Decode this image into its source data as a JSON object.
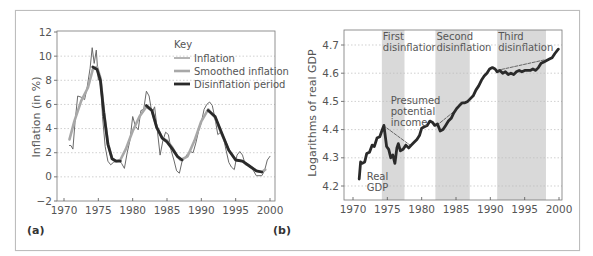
{
  "figure": {
    "panels": [
      "(a)",
      "(b)"
    ]
  },
  "chart_data": [
    {
      "type": "line",
      "panel": "(a)",
      "title": "",
      "xlabel": "",
      "ylabel": "Inflation (in %)",
      "xlim": [
        1970,
        2000
      ],
      "ylim": [
        -2,
        12
      ],
      "x_ticks": [
        1970,
        1975,
        1980,
        1985,
        1990,
        1995,
        2000
      ],
      "y_ticks": [
        -2,
        0,
        2,
        4,
        6,
        8,
        10,
        12
      ],
      "grid": "horizontal dotted",
      "legend": {
        "title": "Key",
        "position": "upper right",
        "entries": [
          "Inflation",
          "Smoothed inflation",
          "Disinflation period"
        ]
      },
      "series": [
        {
          "name": "Inflation",
          "style": "thin dark gray",
          "x": [
            1970.8,
            1971.0,
            1971.3,
            1971.6,
            1972.0,
            1972.5,
            1973.0,
            1973.4,
            1973.8,
            1974.1,
            1974.4,
            1974.7,
            1975.0,
            1975.3,
            1975.6,
            1976.0,
            1976.4,
            1976.8,
            1977.2,
            1977.6,
            1978.0,
            1978.4,
            1978.8,
            1979.2,
            1979.6,
            1980.0,
            1980.4,
            1980.8,
            1981.2,
            1981.6,
            1982.0,
            1982.4,
            1982.8,
            1983.2,
            1983.6,
            1984.0,
            1984.4,
            1984.8,
            1985.2,
            1985.6,
            1986.0,
            1986.4,
            1986.8,
            1987.2,
            1987.6,
            1988.0,
            1988.4,
            1988.8,
            1989.2,
            1989.6,
            1990.0,
            1990.4,
            1990.8,
            1991.2,
            1991.6,
            1992.0,
            1992.4,
            1992.8,
            1993.2,
            1993.6,
            1994.0,
            1994.4,
            1994.8,
            1995.2,
            1995.6,
            1996.0,
            1996.4,
            1996.8,
            1997.2,
            1997.6,
            1998.0,
            1998.4,
            1998.8,
            1999.2,
            1999.6,
            2000.0
          ],
          "y": [
            2.6,
            2.6,
            2.3,
            4.5,
            6.7,
            6.6,
            6.4,
            7.5,
            9.0,
            10.7,
            9.4,
            10.5,
            8.0,
            8.3,
            5.0,
            2.5,
            1.3,
            1.0,
            1.2,
            1.3,
            1.4,
            1.1,
            0.7,
            2.0,
            3.0,
            5.0,
            4.2,
            3.9,
            5.5,
            5.6,
            7.1,
            6.7,
            5.3,
            5.8,
            3.8,
            1.8,
            3.0,
            3.7,
            3.5,
            2.2,
            1.4,
            0.5,
            0.3,
            1.3,
            1.6,
            1.9,
            2.1,
            2.0,
            2.8,
            3.8,
            4.5,
            5.6,
            6.0,
            6.2,
            5.9,
            4.8,
            3.5,
            3.7,
            3.3,
            2.2,
            1.2,
            0.8,
            0.6,
            1.8,
            2.1,
            1.8,
            1.0,
            1.0,
            0.8,
            0.5,
            0.1,
            0.1,
            0.1,
            0.5,
            1.4,
            1.7
          ]
        },
        {
          "name": "Smoothed inflation",
          "style": "thick light gray",
          "x": [
            1970.8,
            1971.5,
            1972.5,
            1973.5,
            1974.2,
            1974.8,
            1975.3,
            1975.8,
            1976.4,
            1977.0,
            1977.6,
            1978.2,
            1979.0,
            1980.0,
            1981.0,
            1982.0,
            1982.8,
            1983.5,
            1984.3,
            1985.0,
            1985.8,
            1986.5,
            1987.0,
            1988.0,
            1989.0,
            1990.0,
            1991.0,
            1992.0,
            1993.0,
            1994.0,
            1995.0,
            1996.0,
            1997.0,
            1998.0,
            1998.8,
            1999.3
          ],
          "y": [
            3.1,
            4.6,
            6.3,
            7.4,
            8.9,
            9.1,
            8.2,
            5.5,
            2.8,
            1.5,
            1.3,
            1.4,
            2.3,
            3.8,
            5.0,
            5.8,
            5.5,
            4.1,
            3.2,
            3.0,
            2.4,
            1.7,
            1.4,
            1.7,
            3.0,
            4.6,
            5.6,
            4.9,
            3.5,
            2.2,
            1.4,
            1.3,
            0.9,
            0.5,
            0.4,
            0.6
          ]
        },
        {
          "name": "Disinflation period",
          "style": "thick black",
          "segments": [
            {
              "x": [
                1974.2,
                1974.8,
                1975.3,
                1975.8,
                1976.4,
                1977.0,
                1977.6,
                1978.2
              ],
              "y": [
                9.1,
                8.9,
                8.0,
                5.3,
                2.7,
                1.5,
                1.3,
                1.3
              ]
            },
            {
              "x": [
                1982.0,
                1982.8,
                1983.5,
                1984.3,
                1985.0,
                1985.8,
                1986.5,
                1987.2
              ],
              "y": [
                5.9,
                5.5,
                4.1,
                3.2,
                2.9,
                2.3,
                1.7,
                1.4
              ]
            },
            {
              "x": [
                1991.0,
                1992.0,
                1993.0,
                1994.0,
                1995.0,
                1996.0,
                1997.0,
                1998.0,
                1998.8
              ],
              "y": [
                5.5,
                5.0,
                3.6,
                2.2,
                1.4,
                1.3,
                0.9,
                0.5,
                0.4
              ]
            }
          ]
        }
      ]
    },
    {
      "type": "line",
      "panel": "(b)",
      "title": "",
      "xlabel": "",
      "ylabel": "Logarithms of real GDP",
      "xlim": [
        1970,
        2000
      ],
      "ylim": [
        4.15,
        4.75
      ],
      "x_ticks": [
        1970,
        1975,
        1980,
        1985,
        1990,
        1995,
        2000
      ],
      "y_ticks": [
        4.2,
        4.3,
        4.4,
        4.5,
        4.6,
        4.7
      ],
      "grid": "horizontal dotted",
      "shaded_regions": [
        {
          "label": "First disinflation",
          "line1": "First",
          "line2": "disinflation",
          "x": [
            1974.2,
            1977.5
          ]
        },
        {
          "label": "Second disinflation",
          "line1": "Second",
          "line2": "disinflation",
          "x": [
            1982.0,
            1987.0
          ]
        },
        {
          "label": "Third disinflation",
          "line1": "Third",
          "line2": "disinflation",
          "x": [
            1991.0,
            1998.1
          ]
        }
      ],
      "annotations": [
        {
          "text_lines": [
            "Presumed",
            "potential",
            "income"
          ],
          "x": 1975.5,
          "y": 4.49
        },
        {
          "text_lines": [
            "Real",
            "GDP"
          ],
          "x": 1972.0,
          "y": 4.22
        }
      ],
      "series": [
        {
          "name": "Real GDP",
          "style": "thick black",
          "x": [
            1970.9,
            1971.1,
            1971.3,
            1971.7,
            1972.0,
            1972.4,
            1972.8,
            1973.1,
            1973.5,
            1973.9,
            1974.2,
            1974.5,
            1974.9,
            1975.2,
            1975.5,
            1975.8,
            1976.1,
            1976.4,
            1976.6,
            1976.9,
            1977.3,
            1977.7,
            1978.1,
            1978.5,
            1978.9,
            1979.3,
            1979.7,
            1980.0,
            1980.4,
            1980.8,
            1981.2,
            1981.6,
            1981.9,
            1982.3,
            1982.7,
            1983.1,
            1983.5,
            1983.9,
            1984.3,
            1984.7,
            1985.1,
            1985.5,
            1985.9,
            1986.3,
            1986.7,
            1987.1,
            1987.5,
            1987.9,
            1988.3,
            1988.7,
            1989.1,
            1989.5,
            1989.9,
            1990.3,
            1990.7,
            1991.0,
            1991.4,
            1991.8,
            1992.2,
            1992.6,
            1993.0,
            1993.4,
            1993.8,
            1994.2,
            1994.6,
            1995.0,
            1995.4,
            1995.8,
            1996.2,
            1996.6,
            1997.0,
            1997.4,
            1997.8,
            1998.2,
            1998.6,
            1999.0,
            1999.4,
            1999.9
          ],
          "y": [
            4.225,
            4.285,
            4.28,
            4.285,
            4.315,
            4.32,
            4.345,
            4.34,
            4.37,
            4.375,
            4.395,
            4.415,
            4.34,
            4.33,
            4.3,
            4.31,
            4.28,
            4.335,
            4.35,
            4.325,
            4.33,
            4.345,
            4.335,
            4.345,
            4.355,
            4.365,
            4.38,
            4.405,
            4.41,
            4.415,
            4.43,
            4.425,
            4.415,
            4.42,
            4.395,
            4.4,
            4.415,
            4.43,
            4.44,
            4.46,
            4.475,
            4.485,
            4.495,
            4.495,
            4.5,
            4.51,
            4.52,
            4.54,
            4.555,
            4.575,
            4.59,
            4.6,
            4.615,
            4.62,
            4.615,
            4.605,
            4.61,
            4.6,
            4.605,
            4.595,
            4.6,
            4.595,
            4.605,
            4.61,
            4.605,
            4.61,
            4.61,
            4.61,
            4.615,
            4.61,
            4.62,
            4.635,
            4.64,
            4.645,
            4.65,
            4.655,
            4.67,
            4.685
          ]
        },
        {
          "name": "Presumed potential income",
          "style": "thin dashed black",
          "segments": [
            {
              "x": [
                1974.4,
                1978.3
              ],
              "y": [
                4.415,
                4.345
              ]
            },
            {
              "x": [
                1982.2,
                1985.0
              ],
              "y": [
                4.415,
                4.47
              ]
            },
            {
              "x": [
                1991.0,
                1998.0
              ],
              "y": [
                4.61,
                4.648
              ]
            }
          ]
        }
      ]
    }
  ]
}
